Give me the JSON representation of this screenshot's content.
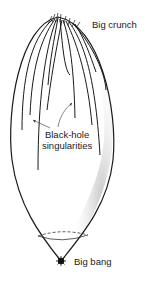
{
  "diagram": {
    "labels": {
      "big_crunch": "Big crunch",
      "black_hole_line1": "Black-hole",
      "black_hole_line2": "singularities",
      "big_bang": "Big bang"
    },
    "colors": {
      "ink": "#1a1a1a",
      "background": "#ffffff"
    }
  }
}
